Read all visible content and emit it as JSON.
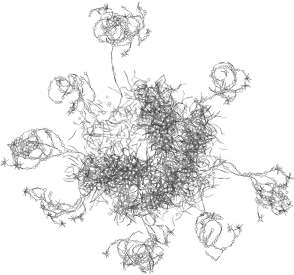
{
  "image": {
    "title": "Molecular structure wireframe render",
    "width": 294,
    "height": 275,
    "background_color": "#ffffff",
    "render_style": "stick-and-ball wireframe, grayscale, orthographic",
    "has_text_labels": false,
    "has_axes": false,
    "has_legend": false,
    "has_ui_chrome": false
  },
  "palette": {
    "bond_dark": "#3a3a3a",
    "bond_mid": "#6b6b6b",
    "bond_light": "#9a9a9a",
    "atom_outline": "#5a5a5a",
    "atom_fill": "#ffffff",
    "background": "#ffffff"
  },
  "structure": {
    "name": "dendritic macromolecule",
    "description": "Dense toroidal core of overlapping bonds with a light central cavity, surrounded by four thin branching peripheral arms.",
    "bounding_box": {
      "x": 20,
      "y": 18,
      "width": 262,
      "height": 244
    },
    "core": {
      "name": "dense-toroidal-core",
      "center_x": 145,
      "center_y": 150,
      "outer_radius_x": 78,
      "outer_radius_y": 72,
      "cavity": {
        "center_x": 147,
        "center_y": 153,
        "radius_x": 11,
        "radius_y": 10
      },
      "segment_count": 5200,
      "node_count": 1500,
      "bond_length_min": 2.0,
      "bond_length_max": 5.5,
      "density_falloff": 2.1
    },
    "arms": [
      {
        "name": "arm-upper",
        "label": "upper tendril",
        "start_x": 126,
        "start_y": 96,
        "end_x": 112,
        "end_y": 26,
        "spread": 26,
        "segment_count": 330,
        "branch_depth": 4
      },
      {
        "name": "arm-left",
        "label": "left tendril",
        "start_x": 78,
        "start_y": 148,
        "end_x": 24,
        "end_y": 150,
        "spread": 30,
        "segment_count": 300,
        "branch_depth": 4
      },
      {
        "name": "arm-lower-left",
        "label": "lower-left tendril",
        "start_x": 92,
        "start_y": 186,
        "end_x": 52,
        "end_y": 202,
        "spread": 24,
        "segment_count": 180,
        "branch_depth": 3
      },
      {
        "name": "arm-right",
        "label": "right tendril",
        "start_x": 212,
        "start_y": 160,
        "end_x": 280,
        "end_y": 196,
        "spread": 26,
        "segment_count": 320,
        "branch_depth": 4
      },
      {
        "name": "arm-upper-right",
        "label": "upper-right tendril",
        "start_x": 196,
        "start_y": 104,
        "end_x": 224,
        "end_y": 80,
        "spread": 18,
        "segment_count": 150,
        "branch_depth": 3
      },
      {
        "name": "arm-bottom",
        "label": "bottom tendril",
        "start_x": 132,
        "start_y": 212,
        "end_x": 142,
        "end_y": 256,
        "spread": 34,
        "segment_count": 330,
        "branch_depth": 4
      },
      {
        "name": "arm-bottom-right",
        "label": "bottom-right tendril",
        "start_x": 186,
        "start_y": 206,
        "end_x": 214,
        "end_y": 232,
        "spread": 20,
        "segment_count": 150,
        "branch_depth": 3
      },
      {
        "name": "arm-upper-left",
        "label": "upper-left tendril",
        "start_x": 96,
        "start_y": 112,
        "end_x": 68,
        "end_y": 88,
        "spread": 18,
        "segment_count": 140,
        "branch_depth": 3
      }
    ],
    "random_seed": 20240517
  }
}
